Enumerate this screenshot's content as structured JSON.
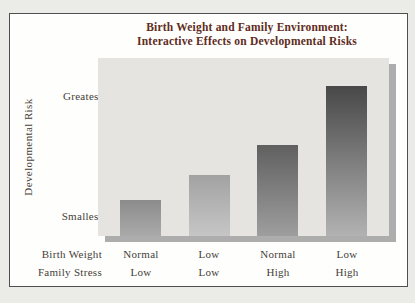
{
  "colors": {
    "page_bg": "#ebebe7",
    "panel_bg": "#fefefc",
    "panel_border": "#4f4f4f",
    "plot_bg": "#e5e4e1",
    "shadow": "#adadad",
    "title_text": "#5f2c22",
    "label_text": "#45403a"
  },
  "chart_data": {
    "type": "bar",
    "title": "Birth Weight and Family Environment: Interactive Effects on Developmental Risks",
    "title_lines": [
      "Birth Weight and Family Environment:",
      "Interactive Effects on Developmental Risks"
    ],
    "ylabel": "Developmental Risk",
    "xlabel": "",
    "value_axis": {
      "scale": "qualitative",
      "min_label": "Smallest",
      "max_label": "Greatest"
    },
    "y_tick_labels": {
      "top": "Greatest",
      "bottom": "Smallest"
    },
    "grid": false,
    "legend": false,
    "x_rows": [
      {
        "label": "Birth Weight",
        "values": [
          "Normal",
          "Low",
          "Normal",
          "Low"
        ]
      },
      {
        "label": "Family Stress",
        "values": [
          "Low",
          "Low",
          "High",
          "High"
        ]
      }
    ],
    "bars": [
      {
        "category": "Normal birth weight / Low family stress",
        "relative_height_pct": 20.2,
        "color_top": "#8c8c8c",
        "color_bottom": "#aaaaaa"
      },
      {
        "category": "Low birth weight / Low family stress",
        "relative_height_pct": 34.3,
        "color_top": "#a2a2a2",
        "color_bottom": "#c6c6c6"
      },
      {
        "category": "Normal birth weight / High family stress",
        "relative_height_pct": 51.1,
        "color_top": "#606060",
        "color_bottom": "#9e9e9e"
      },
      {
        "category": "Low birth weight / High family stress",
        "relative_height_pct": 84.3,
        "color_top": "#484848",
        "color_bottom": "#b2b2b2"
      }
    ]
  }
}
